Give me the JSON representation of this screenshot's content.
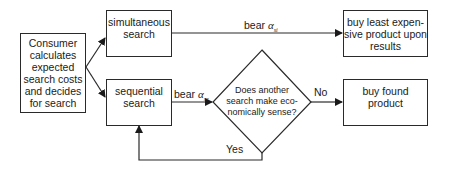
{
  "diagram": {
    "nodes": {
      "consumer": {
        "label": "Consumer calculates expected search costs and decides for search",
        "lines": [
          "Consumer",
          "calculates",
          "expected",
          "search costs",
          "and decides",
          "for search"
        ]
      },
      "simultaneous": {
        "lines": [
          "simultaneous",
          "search"
        ]
      },
      "sequential": {
        "lines": [
          "sequential",
          "search"
        ]
      },
      "decision": {
        "lines": [
          "Does another",
          "search make eco-",
          "nomically sense?"
        ]
      },
      "buy_least": {
        "lines": [
          "buy least expen-",
          "sive product upon",
          "results"
        ]
      },
      "buy_found": {
        "lines": [
          "buy found product"
        ]
      }
    },
    "edges": {
      "simultaneous_to_buy_least": {
        "label_prefix": "bear",
        "symbol": "α",
        "subscript": "si"
      },
      "sequential_to_decision": {
        "label_prefix": "bear",
        "symbol": "α",
        "subscript": "se"
      },
      "decision_no": {
        "label": "No"
      },
      "decision_yes": {
        "label": "Yes"
      }
    },
    "colors": {
      "stroke": "#2a2a2a",
      "text": "#1a1a1a",
      "background": "#ffffff"
    }
  }
}
